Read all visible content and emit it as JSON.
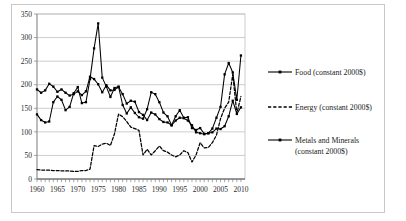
{
  "figure": {
    "background_color": "#ffffff",
    "frame_color": "#c9c9c9",
    "grid_color": "#b7b7b7",
    "line_color": "#000000"
  },
  "chart_data": {
    "type": "line",
    "title": "",
    "xlabel": "",
    "ylabel": "",
    "xlim": [
      1960,
      2011
    ],
    "ylim": [
      0,
      350
    ],
    "yticks": [
      0,
      50,
      100,
      150,
      200,
      250,
      300,
      350
    ],
    "xticks": [
      1960,
      1965,
      1970,
      1975,
      1980,
      1985,
      1990,
      1995,
      2000,
      2005,
      2010
    ],
    "grid": "horizontal",
    "legend_position": "right",
    "x": [
      1960,
      1961,
      1962,
      1963,
      1964,
      1965,
      1966,
      1967,
      1968,
      1969,
      1970,
      1971,
      1972,
      1973,
      1974,
      1975,
      1976,
      1977,
      1978,
      1979,
      1980,
      1981,
      1982,
      1983,
      1984,
      1985,
      1986,
      1987,
      1988,
      1989,
      1990,
      1991,
      1992,
      1993,
      1994,
      1995,
      1996,
      1997,
      1998,
      1999,
      2000,
      2001,
      2002,
      2003,
      2004,
      2005,
      2006,
      2007,
      2008,
      2009,
      2010
    ],
    "series": [
      {
        "name": "Food (constant 2000$)",
        "marker": "square",
        "dash": "solid",
        "values": [
          190,
          183,
          188,
          202,
          196,
          185,
          190,
          183,
          177,
          180,
          186,
          178,
          186,
          217,
          212,
          201,
          184,
          199,
          188,
          189,
          195,
          180,
          160,
          166,
          164,
          142,
          136,
          125,
          141,
          137,
          127,
          121,
          120,
          114,
          124,
          130,
          129,
          124,
          114,
          99,
          97,
          95,
          97,
          99,
          107,
          106,
          112,
          133,
          166,
          138,
          152
        ]
      },
      {
        "name": "Energy (constant 2000$)",
        "marker": "none",
        "dash": "dashed",
        "values": [
          20,
          19,
          19,
          19,
          18,
          18,
          17,
          17,
          17,
          16,
          16,
          18,
          18,
          21,
          71,
          69,
          74,
          76,
          71,
          96,
          138,
          132,
          122,
          110,
          107,
          103,
          51,
          63,
          51,
          60,
          70,
          60,
          57,
          51,
          47,
          51,
          60,
          56,
          36,
          51,
          77,
          66,
          67,
          77,
          93,
          128,
          150,
          163,
          222,
          139,
          175
        ]
      },
      {
        "name": "Metals and Minerals (constant 2000$)",
        "marker": "square",
        "dash": "solid",
        "values": [
          137,
          125,
          120,
          122,
          163,
          175,
          168,
          146,
          153,
          182,
          195,
          161,
          163,
          212,
          277,
          330,
          215,
          196,
          174,
          193,
          196,
          157,
          139,
          152,
          140,
          131,
          128,
          148,
          184,
          180,
          163,
          141,
          133,
          114,
          133,
          146,
          130,
          131,
          108,
          104,
          108,
          96,
          97,
          107,
          130,
          153,
          222,
          246,
          226,
          168,
          262
        ]
      }
    ]
  },
  "axis_labels": {
    "y": [
      "350",
      "300",
      "250",
      "200",
      "150",
      "100",
      "50",
      "0"
    ],
    "x": [
      "1960",
      "1965",
      "1970",
      "1975",
      "1980",
      "1985",
      "1990",
      "1995",
      "2000",
      "2005",
      "2010"
    ]
  },
  "legend": {
    "items": [
      {
        "label": "Food (constant 2000$)",
        "style": "solid-marker"
      },
      {
        "label": "Energy (constant 2000$)",
        "style": "dashed"
      },
      {
        "label": "Metals and Minerals",
        "label2": "(constant 2000$)",
        "style": "solid-marker"
      }
    ]
  }
}
